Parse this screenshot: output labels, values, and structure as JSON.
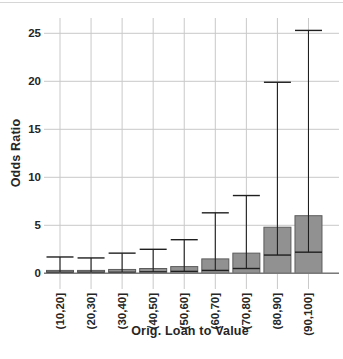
{
  "figure": {
    "background": "#ffffff"
  },
  "chart_data": {
    "type": "bar",
    "title": "",
    "xlabel": "Orig. Loan to Value",
    "ylabel": "Odds Ratio",
    "categories": [
      "(10,20]",
      "(20,30]",
      "(30,40]",
      "(40,50]",
      "(50,60]",
      "(60,70]",
      "(70,80]",
      "(80,90]",
      "(90,100]"
    ],
    "values": [
      0.3,
      0.3,
      0.4,
      0.5,
      0.7,
      1.5,
      2.1,
      4.8,
      6.0
    ],
    "error_bars": {
      "low": [
        0.1,
        0.1,
        0.1,
        0.15,
        0.2,
        0.3,
        0.5,
        1.9,
        2.2
      ],
      "high": [
        1.7,
        1.6,
        2.1,
        2.5,
        3.5,
        6.3,
        8.1,
        19.9,
        25.3
      ]
    },
    "y_ticks": [
      "0",
      "5",
      "10",
      "15",
      "20",
      "25"
    ],
    "ylim": [
      0,
      25.5
    ],
    "grid": "on",
    "legend": "none",
    "colors": {
      "bar_fill": "#919191",
      "bar_border": "#5c5c5c",
      "whisker": "#1f1f1f",
      "gridline": "#c9c9c9",
      "axis_line": "#7a7a7a",
      "text": "#262626"
    }
  }
}
